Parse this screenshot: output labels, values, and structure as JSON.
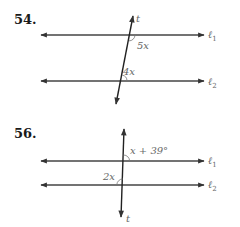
{
  "problems": [
    {
      "number": "54.",
      "transversal_label": "t",
      "line1_label": "ℓ",
      "line1_sub": "1",
      "line2_label": "ℓ",
      "line2_sub": "2",
      "angle1": "5x",
      "angle2": "4x"
    },
    {
      "number": "56.",
      "transversal_label": "t",
      "line1_label": "ℓ",
      "line1_sub": "1",
      "line2_label": "ℓ",
      "line2_sub": "2",
      "angle1": "x + 39°",
      "angle2": "2x"
    }
  ],
  "colors": {
    "line": "#333333",
    "label": "#666666"
  }
}
